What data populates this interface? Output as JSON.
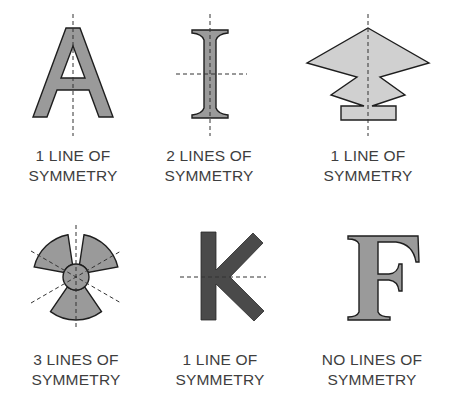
{
  "figures": [
    {
      "id": "A",
      "shape": "letter-A",
      "lines_of_symmetry": 1,
      "symmetry_axes": [
        "vertical"
      ],
      "label_line1": "1 LINE OF",
      "label_line2": "SYMMETRY"
    },
    {
      "id": "I",
      "shape": "letter-I",
      "lines_of_symmetry": 2,
      "symmetry_axes": [
        "vertical",
        "horizontal"
      ],
      "label_line1": "2 LINES OF",
      "label_line2": "SYMMETRY"
    },
    {
      "id": "arrow",
      "shape": "arrowhead-stack",
      "lines_of_symmetry": 1,
      "symmetry_axes": [
        "vertical"
      ],
      "label_line1": "1 LINE OF",
      "label_line2": "SYMMETRY"
    },
    {
      "id": "trefoil",
      "shape": "three-blade-circle",
      "lines_of_symmetry": 3,
      "symmetry_axes": [
        "vertical",
        "diagonal-60",
        "diagonal-120"
      ],
      "label_line1": "3 LINES OF",
      "label_line2": "SYMMETRY"
    },
    {
      "id": "K",
      "shape": "letter-K",
      "lines_of_symmetry": 1,
      "symmetry_axes": [
        "horizontal"
      ],
      "label_line1": "1 LINE OF",
      "label_line2": "SYMMETRY"
    },
    {
      "id": "F",
      "shape": "letter-F",
      "lines_of_symmetry": 0,
      "symmetry_axes": [],
      "label_line1": "NO LINES OF",
      "label_line2": "SYMMETRY"
    }
  ],
  "colors": {
    "shape_fill": "#9a9a9a",
    "light_fill": "#d0d0d0",
    "dark_fill": "#4a4a4a",
    "outline": "#1e1e1e",
    "axis_line": "#333333",
    "text": "#3e3e3e"
  }
}
